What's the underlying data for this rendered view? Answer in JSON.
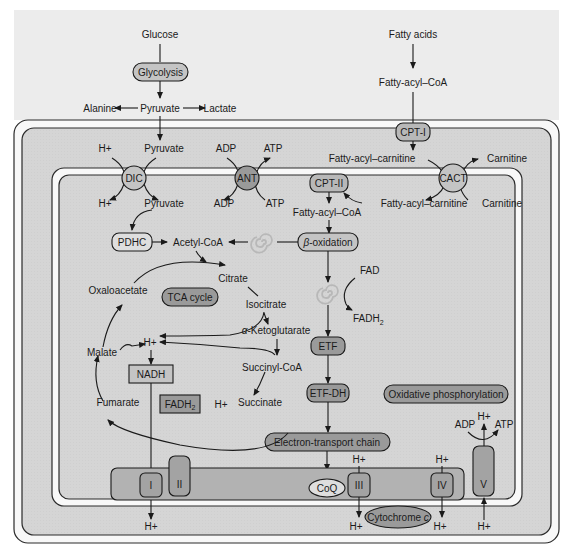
{
  "colors": {
    "background": "#ffffff",
    "outer_area": "#ececec",
    "intermembrane": "#d3d3d3",
    "matrix": "#d6d6d6",
    "membrane_gap": "#f7f7f7",
    "light_box": "#c4c4c4",
    "dark_box": "#9a9a9a",
    "complex_fill": "#a3a3a3",
    "membrane_band": "#b2b2b2",
    "spiral": "#b8b8b8",
    "stroke": "#1a1a1a"
  },
  "cytosol": {
    "glucose": "Glucose",
    "glycolysis": "Glycolysis",
    "pyruvate": "Pyruvate",
    "alanine": "Alanine",
    "lactate": "Lactate",
    "fatty_acids": "Fatty acids",
    "fatty_acyl_coa": "Fatty-acyl–CoA"
  },
  "outer_membrane": {
    "cpt1": "CPT-I"
  },
  "intermembrane_space": {
    "h_plus": "H+",
    "pyruvate": "Pyruvate",
    "adp": "ADP",
    "atp": "ATP",
    "fatty_acyl_carnitine": "Fatty-acyl–carnitine",
    "carnitine": "Carnitine"
  },
  "inner_membrane_transporters": {
    "dic": "DIC",
    "ant": "ANT",
    "cact": "CACT",
    "cpt2": "CPT-II"
  },
  "matrix": {
    "h_plus": "H+",
    "pyruvate": "Pyruvate",
    "adp": "ADP",
    "atp": "ATP",
    "fatty_acyl_carnitine": "Fatty-acyl–carnitine",
    "carnitine": "Carnitine",
    "fatty_acyl_coa": "Fatty-acyl–CoA",
    "pdhc": "PDHC",
    "acetyl_coa": "Acetyl-CoA",
    "beta_oxidation_prefix": "β",
    "beta_oxidation_suffix": "-oxidation",
    "fad": "FAD",
    "fadh2_main": "FADH",
    "fadh2_sub": "2",
    "etf": "ETF",
    "etf_dh": "ETF-DH",
    "oxidative_phosphorylation": "Oxidative phosphorylation",
    "electron_transport_chain": "Electron-transport chain"
  },
  "tca": {
    "title": "TCA cycle",
    "citrate": "Citrate",
    "isocitrate": "Isocitrate",
    "alpha_prefix": "α",
    "alpha_ketoglutarate_suffix": "-Ketoglutarate",
    "succinyl_coa": "Succinyl-CoA",
    "succinate": "Succinate",
    "fumarate": "Fumarate",
    "malate": "Malate",
    "oxaloacetate": "Oxaloacetate",
    "h_plus_center": "H+",
    "h_plus_lower": "H+",
    "nadh": "NADH",
    "fadh2_main": "FADH",
    "fadh2_sub": "2"
  },
  "etc": {
    "complex_1": "I",
    "complex_2": "II",
    "complex_3": "III",
    "complex_4": "IV",
    "complex_5": "V",
    "coq": "CoQ",
    "cytochrome_c_main": "Cytochrome ",
    "cytochrome_c_italic": "c",
    "h_plus": "H+",
    "adp": "ADP",
    "atp": "ATP"
  }
}
